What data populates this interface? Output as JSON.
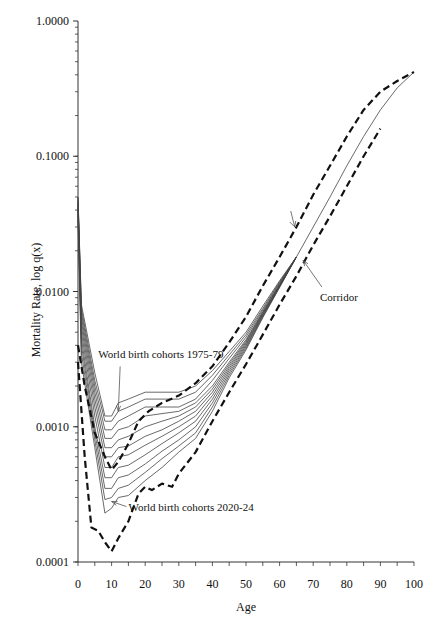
{
  "chart_data": {
    "type": "line",
    "title": "",
    "xlabel": "Age",
    "ylabel": "Mortality Rate, log q(x)",
    "yscale": "log",
    "xlim": [
      0,
      100
    ],
    "ylim": [
      0.0001,
      1.0
    ],
    "x_ticks": [
      0,
      10,
      20,
      30,
      40,
      50,
      60,
      70,
      80,
      90,
      100
    ],
    "y_ticks": [
      {
        "value": 1.0,
        "label": "1.0000"
      },
      {
        "value": 0.1,
        "label": "0.1000"
      },
      {
        "value": 0.01,
        "label": "0.0100"
      },
      {
        "value": 0.001,
        "label": "0.0010"
      },
      {
        "value": 0.0001,
        "label": "0.0001"
      }
    ],
    "grid": false,
    "legend": "none",
    "series": [
      {
        "name": "World birth cohorts 1975-79",
        "style": "solid",
        "x": [
          0,
          1,
          5,
          8,
          10,
          12,
          15,
          20,
          25,
          30,
          35,
          40,
          45,
          50,
          55,
          60,
          65,
          70,
          75,
          80,
          85,
          90,
          95,
          100
        ],
        "values": [
          0.05,
          0.008,
          0.0025,
          0.0012,
          0.0012,
          0.0015,
          0.0016,
          0.0018,
          0.0018,
          0.0018,
          0.002,
          0.0026,
          0.0036,
          0.005,
          0.0078,
          0.012,
          0.018,
          0.03,
          0.05,
          0.085,
          0.14,
          0.22,
          0.32,
          0.42
        ]
      },
      {
        "name": "cohort 2",
        "style": "solid",
        "x": [
          0,
          1,
          5,
          8,
          10,
          12,
          15,
          20,
          25,
          30,
          35,
          40,
          45,
          50,
          55,
          60,
          65
        ],
        "values": [
          0.05,
          0.0075,
          0.0022,
          0.0011,
          0.0011,
          0.0013,
          0.0014,
          0.0016,
          0.0016,
          0.0016,
          0.0018,
          0.0024,
          0.0034,
          0.0048,
          0.0075,
          0.0118,
          0.018
        ]
      },
      {
        "name": "cohort 3",
        "style": "solid",
        "x": [
          0,
          1,
          5,
          8,
          10,
          12,
          15,
          20,
          25,
          30,
          35,
          40,
          45,
          50,
          55,
          60,
          65
        ],
        "values": [
          0.048,
          0.007,
          0.002,
          0.00095,
          0.00095,
          0.0011,
          0.0012,
          0.0014,
          0.0014,
          0.0014,
          0.0016,
          0.0022,
          0.0032,
          0.0046,
          0.0073,
          0.0116,
          0.018
        ]
      },
      {
        "name": "cohort 4",
        "style": "solid",
        "x": [
          0,
          1,
          5,
          8,
          10,
          12,
          15,
          20,
          25,
          30,
          35,
          40,
          45,
          50,
          55,
          60,
          65
        ],
        "values": [
          0.046,
          0.0065,
          0.0018,
          0.00082,
          0.00082,
          0.00095,
          0.001,
          0.0012,
          0.00125,
          0.0013,
          0.0015,
          0.002,
          0.003,
          0.0044,
          0.0071,
          0.0114,
          0.018
        ]
      },
      {
        "name": "cohort 5",
        "style": "solid",
        "x": [
          0,
          1,
          5,
          8,
          10,
          12,
          15,
          20,
          25,
          30,
          35,
          40,
          45,
          50,
          55,
          60,
          65
        ],
        "values": [
          0.045,
          0.006,
          0.0016,
          0.0007,
          0.0007,
          0.0008,
          0.00085,
          0.001,
          0.0011,
          0.0012,
          0.0014,
          0.0019,
          0.0029,
          0.0043,
          0.007,
          0.0112,
          0.018
        ]
      },
      {
        "name": "cohort 6",
        "style": "solid",
        "x": [
          0,
          1,
          5,
          8,
          10,
          12,
          15,
          20,
          25,
          30,
          35,
          40,
          45,
          50,
          55,
          60,
          65
        ],
        "values": [
          0.043,
          0.0055,
          0.0014,
          0.0006,
          0.0006,
          0.0007,
          0.00072,
          0.00085,
          0.00095,
          0.0011,
          0.0013,
          0.0018,
          0.0028,
          0.0042,
          0.0069,
          0.0111,
          0.018
        ]
      },
      {
        "name": "cohort 7",
        "style": "solid",
        "x": [
          0,
          1,
          5,
          8,
          10,
          12,
          15,
          20,
          25,
          30,
          35,
          40,
          45,
          50,
          55,
          60,
          65
        ],
        "values": [
          0.041,
          0.005,
          0.0012,
          0.0005,
          0.0005,
          0.0006,
          0.00062,
          0.00073,
          0.00085,
          0.001,
          0.0012,
          0.0017,
          0.0027,
          0.0041,
          0.0068,
          0.011,
          0.018
        ]
      },
      {
        "name": "cohort 8",
        "style": "solid",
        "x": [
          0,
          1,
          5,
          8,
          10,
          12,
          15,
          20,
          25,
          30,
          35,
          40,
          45,
          50,
          55,
          60,
          65
        ],
        "values": [
          0.04,
          0.0045,
          0.001,
          0.00042,
          0.00042,
          0.0005,
          0.00052,
          0.00062,
          0.00075,
          0.0009,
          0.0011,
          0.0016,
          0.0026,
          0.004,
          0.0067,
          0.011,
          0.018
        ]
      },
      {
        "name": "cohort 9",
        "style": "solid",
        "x": [
          0,
          1,
          5,
          8,
          10,
          12,
          15,
          20,
          25,
          30,
          35,
          40,
          45,
          50,
          55,
          60,
          65
        ],
        "values": [
          0.038,
          0.004,
          0.0009,
          0.00035,
          0.00035,
          0.00042,
          0.00044,
          0.00053,
          0.00066,
          0.0008,
          0.001,
          0.0015,
          0.0025,
          0.0039,
          0.0066,
          0.0109,
          0.018
        ]
      },
      {
        "name": "cohort 10",
        "style": "solid",
        "x": [
          0,
          1,
          5,
          8,
          10,
          12,
          15,
          20,
          25,
          30,
          35,
          40,
          45,
          50,
          55,
          60,
          65
        ],
        "values": [
          0.036,
          0.0035,
          0.0008,
          0.00029,
          0.0003,
          0.00035,
          0.00037,
          0.00046,
          0.00058,
          0.00072,
          0.0009,
          0.0014,
          0.0024,
          0.0038,
          0.0065,
          0.0108,
          0.018
        ]
      },
      {
        "name": "World birth cohorts 2020-24",
        "style": "solid",
        "x": [
          0,
          1,
          5,
          8,
          10,
          12,
          15,
          20,
          25,
          30,
          35,
          40,
          45,
          50,
          55,
          60,
          65
        ],
        "values": [
          0.034,
          0.003,
          0.0007,
          0.00023,
          0.00025,
          0.0003,
          0.00031,
          0.0004,
          0.0005,
          0.00065,
          0.00082,
          0.0013,
          0.0023,
          0.0037,
          0.0064,
          0.0107,
          0.018
        ]
      },
      {
        "name": "Corridor upper",
        "style": "dashed",
        "x": [
          0,
          2,
          5,
          8,
          10,
          12,
          15,
          18,
          21,
          25,
          30,
          35,
          40,
          45,
          50,
          55,
          60,
          65,
          70,
          75,
          80,
          85,
          90,
          95,
          100
        ],
        "values": [
          0.004,
          0.002,
          0.0009,
          0.0006,
          0.00048,
          0.00055,
          0.00075,
          0.0011,
          0.0013,
          0.0015,
          0.0017,
          0.0021,
          0.0028,
          0.0042,
          0.0065,
          0.011,
          0.018,
          0.03,
          0.052,
          0.085,
          0.14,
          0.22,
          0.3,
          0.36,
          0.42
        ]
      },
      {
        "name": "Corridor lower",
        "style": "dashed",
        "x": [
          0,
          2,
          4,
          6,
          8,
          10,
          12,
          15,
          18,
          20,
          22,
          25,
          28,
          30,
          35,
          40,
          45,
          50,
          55,
          60,
          65,
          70,
          75,
          80,
          85,
          90
        ],
        "values": [
          0.003,
          0.0006,
          0.00018,
          0.00017,
          0.00014,
          0.00012,
          0.00015,
          0.0002,
          0.00032,
          0.00036,
          0.00034,
          0.00038,
          0.00036,
          0.00045,
          0.00065,
          0.0011,
          0.0018,
          0.0029,
          0.0048,
          0.008,
          0.013,
          0.022,
          0.036,
          0.06,
          0.1,
          0.16
        ]
      }
    ],
    "annotations": [
      {
        "text": "World birth cohorts 1975-79",
        "x": 6,
        "y": 0.0032,
        "arrow_to": [
          12,
          0.0013
        ]
      },
      {
        "text": "World birth cohorts 2020-24",
        "x": 15,
        "y": 0.00024,
        "arrow_to": [
          10,
          0.00028
        ]
      },
      {
        "text": "Corridor",
        "x": 72,
        "y": 0.0085,
        "arrow_to": [
          67,
          0.017
        ]
      }
    ]
  },
  "labels": {
    "xlabel": "Age",
    "ylabel": "Mortality Rate, log q(x)",
    "annot_1975": "World birth cohorts 1975-79",
    "annot_2020": "World birth cohorts 2020-24",
    "annot_corridor": "Corridor"
  }
}
